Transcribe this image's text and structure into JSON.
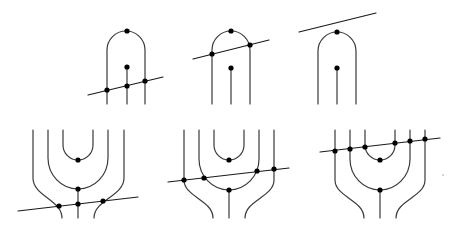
{
  "diagram": {
    "colors": {
      "stroke": "#3a3a3a",
      "dot": "#000000",
      "background": "#ffffff"
    },
    "panels": [
      {
        "id": "top-1",
        "strands": [
          "M107,104 L107,50 A19,19 0 0 1 145,50 L145,104",
          "M127,67 L127,104"
        ],
        "cut_line": [
          88,
          95,
          163,
          77
        ],
        "dots": [
          [
            127,
            31
          ],
          [
            127,
            67
          ],
          [
            107,
            90
          ],
          [
            127,
            86
          ],
          [
            145,
            81
          ]
        ]
      },
      {
        "id": "top-2",
        "strands": [
          "M212,104 L212,50 A19,19 0 0 1 250,50 L250,104",
          "M231,68 L231,104"
        ],
        "cut_line": [
          193,
          59,
          269,
          40
        ],
        "dots": [
          [
            231,
            31
          ],
          [
            231,
            68
          ],
          [
            212,
            54
          ],
          [
            250,
            45
          ]
        ]
      },
      {
        "id": "top-3",
        "strands": [
          "M318,104 L318,51 A19,19 0 0 1 356,51 L356,104",
          "M337,68 L337,104"
        ],
        "cut_line": [
          299,
          32,
          376,
          13
        ],
        "dots": [
          [
            337,
            32
          ],
          [
            337,
            68
          ]
        ]
      },
      {
        "id": "bottom-1",
        "strands": [
          "M63,130 L63,145 A15,15 0 0 0 93,145 L93,130",
          "M48,130 L48,158 A30,31 0 0 0 108,158 L108,130",
          "M78,189 L78,218",
          "M33,130 L33,178 C33,196 62,200 62,218",
          "M124,130 L124,178 C124,196 94,200 94,218"
        ],
        "cut_line": [
          18,
          211,
          138,
          197
        ],
        "dots": [
          [
            78,
            160
          ],
          [
            78,
            189
          ],
          [
            59,
            206
          ],
          [
            78,
            204
          ],
          [
            103,
            201
          ]
        ]
      },
      {
        "id": "bottom-2",
        "strands": [
          "M214,130 L214,145 A15,15 0 0 0 244,145 L244,130",
          "M199,130 L199,159 A30,31 0 0 0 259,159 L259,130",
          "M229,190 L229,218",
          "M184,130 L184,180 C184,197 213,200 213,218",
          "M274,130 L274,180 C274,197 245,200 245,218"
        ],
        "cut_line": [
          168,
          182,
          289,
          168
        ],
        "dots": [
          [
            229,
            160
          ],
          [
            229,
            190
          ],
          [
            184,
            180
          ],
          [
            204,
            178
          ],
          [
            257,
            171
          ],
          [
            274,
            169
          ]
        ]
      },
      {
        "id": "bottom-3",
        "strands": [
          "M365,130 L365,145 A15,15 0 0 0 395,145 L395,130",
          "M350,130 L350,159 A30,31 0 0 0 410,159 L410,130",
          "M380,190 L380,218",
          "M335,130 L335,180 C335,197 364,200 364,218",
          "M425,130 L425,180 C425,197 396,200 396,218"
        ],
        "cut_line": [
          320,
          152,
          440,
          138
        ],
        "dots": [
          [
            380,
            160
          ],
          [
            380,
            190
          ],
          [
            335,
            151
          ],
          [
            350,
            149
          ],
          [
            365,
            147
          ],
          [
            395,
            143
          ],
          [
            410,
            141
          ],
          [
            425,
            139
          ]
        ]
      }
    ],
    "specks": [
      [
        443,
        175
      ]
    ]
  }
}
